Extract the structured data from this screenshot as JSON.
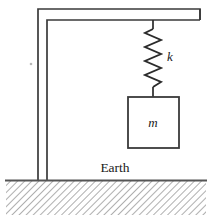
{
  "figure": {
    "type": "physics-schematic",
    "colors": {
      "stroke": "#3a3a3a",
      "stroke_dark": "#2b2b2b",
      "ground_line": "#555555",
      "hatch": "#9a9a9a",
      "background": "#ffffff",
      "text": "#1a1a1a"
    },
    "labels": {
      "spring_constant": "k",
      "mass": "m",
      "ground": "Earth"
    },
    "geometry": {
      "canvas_width": 213,
      "canvas_height": 222,
      "post": {
        "outer_x": 38,
        "inner_x": 47,
        "top_y": 9,
        "bottom_y": 180
      },
      "beam": {
        "left_x": 38,
        "right_x": 200,
        "top_y": 9,
        "bottom_y": 20
      },
      "spring": {
        "center_x": 153,
        "top_y": 20,
        "lead_top_y": 29,
        "coil_top_y": 29,
        "coil_bottom_y": 87,
        "lead_bottom_y": 97,
        "amplitude": 8,
        "turns": 8
      },
      "mass_box": {
        "x": 128,
        "y": 97,
        "width": 51,
        "height": 51
      },
      "ground": {
        "line_y": 180,
        "line_x1": 5,
        "line_x2": 207,
        "hatch_top": 181,
        "hatch_bottom": 215,
        "hatch_x1": 6,
        "hatch_x2": 206,
        "hatch_spacing": 5
      },
      "earth_label_pos": {
        "x": 115,
        "y": 172
      },
      "k_label_pos": {
        "x": 170,
        "y": 61
      },
      "m_label_pos": {
        "x": 153,
        "y": 127
      }
    }
  }
}
